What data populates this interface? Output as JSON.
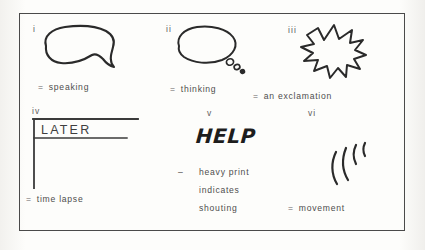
{
  "page": {
    "background_color": "#fbfbf9",
    "ink_color": "#2a2a2a",
    "frame_color": "#4a4a4a"
  },
  "figure": {
    "type": "diagram",
    "items": [
      {
        "numeral": "i",
        "glyph": "speech-balloon",
        "equals": "=",
        "caption": "speaking"
      },
      {
        "numeral": "ii",
        "glyph": "thought-balloon",
        "equals": "=",
        "caption": "thinking"
      },
      {
        "numeral": "iii",
        "glyph": "starburst-balloon",
        "equals": "=",
        "caption": "an exclamation"
      },
      {
        "numeral": "iv",
        "glyph": "time-lapse-bracket",
        "equals": "=",
        "caption": "time lapse",
        "lettering": "LATER"
      },
      {
        "numeral": "v",
        "glyph": "heavy-lettering",
        "equals": "–",
        "lettering": "HELP",
        "caption_lines": [
          "heavy print",
          "indicates",
          "shouting"
        ]
      },
      {
        "numeral": "vi",
        "glyph": "motion-lines",
        "equals": "=",
        "caption": "movement"
      }
    ]
  }
}
